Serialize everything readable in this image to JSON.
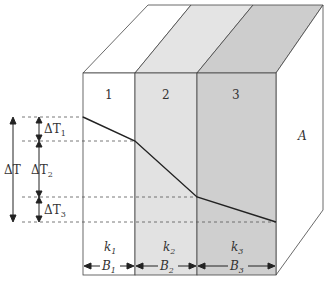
{
  "diagram": {
    "layers": [
      {
        "id": "1",
        "conductivity": "k",
        "conductivity_sub": "1",
        "thickness": "B",
        "thickness_sub": "1",
        "color": "#ffffff"
      },
      {
        "id": "2",
        "conductivity": "k",
        "conductivity_sub": "2",
        "thickness": "B",
        "thickness_sub": "2",
        "color": "#e2e2e2"
      },
      {
        "id": "3",
        "conductivity": "k",
        "conductivity_sub": "3",
        "thickness": "B",
        "thickness_sub": "3",
        "color": "#cfcfcf"
      }
    ],
    "area_label": "A",
    "temperature_drops": {
      "total": {
        "label": "ΔT",
        "base": "ΔT",
        "sub": ""
      },
      "parts": [
        {
          "base": "ΔT",
          "sub": "1"
        },
        {
          "base": "ΔT",
          "sub": "2"
        },
        {
          "base": "ΔT",
          "sub": "3"
        }
      ]
    },
    "colors": {
      "line": "#333333",
      "dashed": "#555555",
      "layer1": "#ffffff",
      "layer2": "#e2e2e2",
      "layer3": "#cfcfcf"
    }
  }
}
